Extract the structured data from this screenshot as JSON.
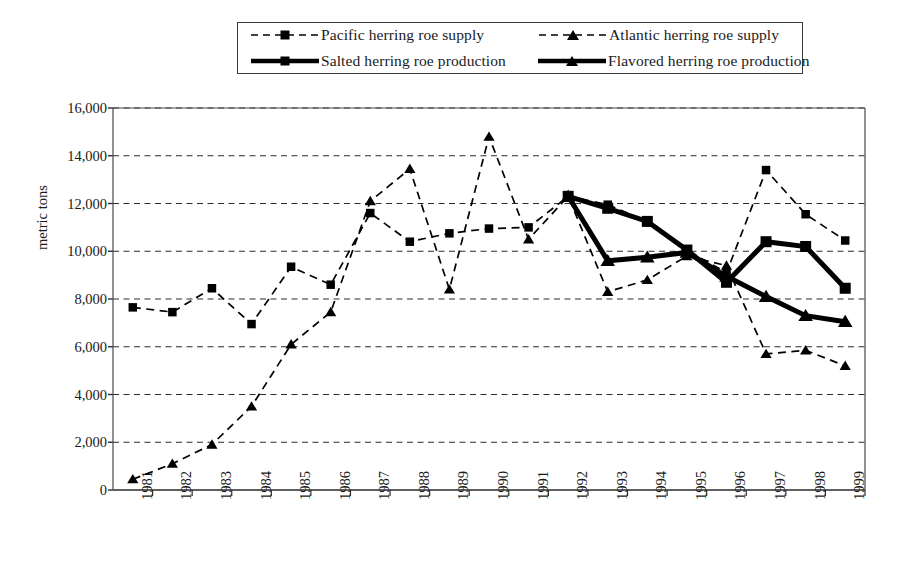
{
  "legend": {
    "items": [
      {
        "label": "Pacific herring roe supply",
        "marker": "square-marker",
        "style": "dashed",
        "color": "#000000"
      },
      {
        "label": "Atlantic herring roe supply",
        "marker": "triangle-marker",
        "style": "dashed",
        "color": "#000000"
      },
      {
        "label": "Salted herring roe production",
        "marker": "square-marker",
        "style": "solid",
        "color": "#000000"
      },
      {
        "label": "Flavored herring roe production",
        "marker": "triangle-marker",
        "style": "solid",
        "color": "#000000"
      }
    ]
  },
  "axes": {
    "ylabel": "metric tons",
    "yticks": [
      "16,000",
      "14,000",
      "12,000",
      "10,000",
      "8,000",
      "6,000",
      "4,000",
      "2,000",
      "0"
    ],
    "xticks": [
      "1981",
      "1982",
      "1983",
      "1984",
      "1985",
      "1986",
      "1987",
      "1988",
      "1989",
      "1990",
      "1991",
      "1992",
      "1993",
      "1994",
      "1995",
      "1996",
      "1997",
      "1998",
      "1999"
    ]
  },
  "chart_data": {
    "type": "line",
    "title": "",
    "xlabel": "",
    "ylabel": "metric tons",
    "ylim": [
      0,
      16000
    ],
    "ytick_step": 2000,
    "grid": "horizontal-dashed",
    "legend_position": "top-center",
    "x": [
      1981,
      1982,
      1983,
      1984,
      1985,
      1986,
      1987,
      1988,
      1989,
      1990,
      1991,
      1992,
      1993,
      1994,
      1995,
      1996,
      1997,
      1998,
      1999
    ],
    "series": [
      {
        "name": "Pacific herring roe supply",
        "marker": "square",
        "line": "dashed",
        "x": [
          1981,
          1982,
          1983,
          1984,
          1985,
          1986,
          1987,
          1988,
          1989,
          1990,
          1991,
          1992,
          1993,
          1994,
          1995,
          1996,
          1997,
          1998,
          1999
        ],
        "values": [
          7650,
          7450,
          8450,
          6950,
          9350,
          8600,
          11600,
          10400,
          10750,
          10950,
          11000,
          12300,
          11950,
          11250,
          10050,
          9100,
          13400,
          11550,
          10450
        ]
      },
      {
        "name": "Atlantic herring roe supply",
        "marker": "triangle",
        "line": "dashed",
        "x": [
          1981,
          1982,
          1983,
          1984,
          1985,
          1986,
          1987,
          1988,
          1989,
          1990,
          1991,
          1992,
          1993,
          1994,
          1995,
          1996,
          1997,
          1998,
          1999
        ],
        "values": [
          450,
          1100,
          1900,
          3500,
          6100,
          7450,
          12100,
          13450,
          8400,
          14800,
          10500,
          12300,
          8300,
          8800,
          9800,
          9400,
          5700,
          5850,
          5200
        ]
      },
      {
        "name": "Salted herring roe production",
        "marker": "square",
        "line": "solid",
        "x": [
          1992,
          1993,
          1994,
          1995,
          1996,
          1997,
          1998,
          1999
        ],
        "values": [
          12300,
          11800,
          11250,
          10050,
          8700,
          10400,
          10200,
          8450
        ]
      },
      {
        "name": "Flavored herring roe production",
        "marker": "triangle",
        "line": "solid",
        "x": [
          1992,
          1993,
          1994,
          1995,
          1996,
          1997,
          1998,
          1999
        ],
        "values": [
          12300,
          9600,
          9750,
          9950,
          8950,
          8100,
          7300,
          7050
        ]
      }
    ]
  }
}
